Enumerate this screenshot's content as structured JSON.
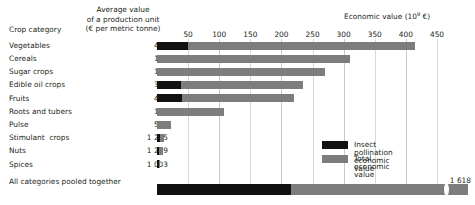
{
  "header": {
    "crop_category": "Crop category",
    "avg_value_line1": "Average value",
    "avg_value_line2": "of a production unit",
    "avg_value_line3": "(€ per metric tonne)",
    "economic_value_label": "Economic value (10",
    "economic_value_exp": "9",
    "economic_value_unit": " €)"
  },
  "legend": {
    "items": [
      {
        "label": "Insect pollination economic value",
        "color": "#111111",
        "key": "pollination"
      },
      {
        "label": "Total economic value",
        "color": "#7d7d7d",
        "key": "total"
      }
    ]
  },
  "axis": {
    "ticks": [
      "50",
      "100",
      "150",
      "200",
      "250",
      "300",
      "350",
      "400",
      "450"
    ],
    "tick_values": [
      50,
      100,
      150,
      200,
      250,
      300,
      350,
      400,
      450
    ]
  },
  "pooled": {
    "label": "All categories pooled together",
    "total_label": "1 618"
  },
  "chart_data": {
    "type": "bar",
    "orientation": "horizontal",
    "title": "",
    "xlabel": "Economic value (10^9 €)",
    "ylabel": "Crop category",
    "xlim": [
      0,
      450
    ],
    "grid": true,
    "legend_position": "inside-right",
    "value_column_header": "Average value of a production unit (€ per metric tonne)",
    "categories": [
      "Vegetables",
      "Cereals",
      "Sugar crops",
      "Edible oil crops",
      "Fruits",
      "Roots and tubers",
      "Pulse",
      "Stimulant  crops",
      "Nuts",
      "Spices"
    ],
    "avg_unit_values": [
      "468",
      "139",
      "177",
      "385",
      "452",
      "137",
      "515",
      "1 225",
      "1 269",
      "1 003"
    ],
    "series": [
      {
        "name": "Insect pollination economic value",
        "color": "#111111",
        "values": [
          50,
          0,
          0,
          38,
          40,
          0,
          0,
          5,
          4,
          1
        ]
      },
      {
        "name": "Total economic value",
        "color": "#7d7d7d",
        "values": [
          415,
          310,
          270,
          235,
          220,
          108,
          22,
          11,
          9,
          5
        ]
      }
    ],
    "pooled_total": {
      "category": "All categories pooled together",
      "pollination": 215,
      "total": 1618,
      "axis_break": true
    }
  },
  "rows": [
    {
      "label": "Vegetables",
      "value": "468",
      "black": 50,
      "total": 415
    },
    {
      "label": "Cereals",
      "value": "139",
      "black": 0,
      "total": 310
    },
    {
      "label": "Sugar crops",
      "value": "177",
      "black": 0,
      "total": 270
    },
    {
      "label": "Edible oil crops",
      "value": "385",
      "black": 38,
      "total": 235
    },
    {
      "label": "Fruits",
      "value": "452",
      "black": 40,
      "total": 220
    },
    {
      "label": "Roots and tubers",
      "value": "137",
      "black": 0,
      "total": 108
    },
    {
      "label": "Pulse",
      "value": "515",
      "black": 0,
      "total": 22
    },
    {
      "label": "Stimulant  crops",
      "value": "1 225",
      "black": 5,
      "total": 11
    },
    {
      "label": "Nuts",
      "value": "1 269",
      "black": 4,
      "total": 9
    },
    {
      "label": "Spices",
      "value": "1 003",
      "black": 1,
      "total": 5
    }
  ]
}
